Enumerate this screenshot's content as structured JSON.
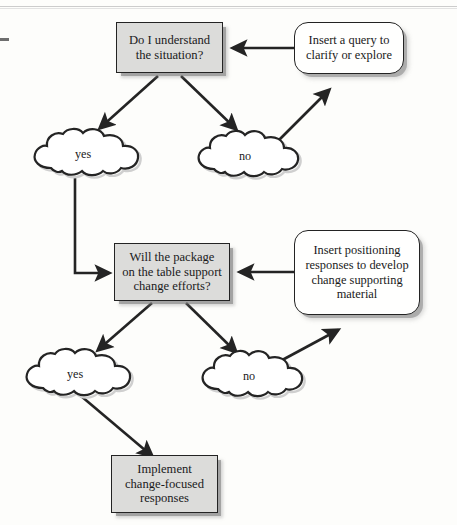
{
  "page": {
    "kind": "scanned-book-figure",
    "background_color": "#fdfdfb",
    "ink_color": "#1a1a1a",
    "box_fill_gray": "#dcdcda",
    "box_fill_white": "#fffffe",
    "border_color": "#232323"
  },
  "diagram": {
    "type": "flowchart",
    "title": "",
    "nodes": [
      {
        "id": "q1",
        "shape": "rectangle",
        "fill": "gray",
        "lines": [
          "Do I understand",
          "the situation?"
        ],
        "text": "Do I understand the situation?"
      },
      {
        "id": "insert1",
        "shape": "rounded-rectangle",
        "fill": "white",
        "lines": [
          "Insert a query to",
          "clarify or explore"
        ],
        "text": "Insert a query to clarify or explore"
      },
      {
        "id": "yes1",
        "shape": "cloud",
        "fill": "white",
        "lines": [
          "yes"
        ],
        "text": "yes"
      },
      {
        "id": "no1",
        "shape": "cloud",
        "fill": "white",
        "lines": [
          "no"
        ],
        "text": "no"
      },
      {
        "id": "q2",
        "shape": "rectangle",
        "fill": "gray",
        "lines": [
          "Will the package",
          "on the table support",
          "change efforts?"
        ],
        "text": "Will the package on the table support change efforts?"
      },
      {
        "id": "insert2",
        "shape": "rounded-rectangle",
        "fill": "white",
        "lines": [
          "Insert positioning",
          "responses to develop",
          "change supporting",
          "material"
        ],
        "text": "Insert positioning responses to develop change supporting material"
      },
      {
        "id": "yes2",
        "shape": "cloud",
        "fill": "white",
        "lines": [
          "yes"
        ],
        "text": "yes"
      },
      {
        "id": "no2",
        "shape": "cloud",
        "fill": "white",
        "lines": [
          "no"
        ],
        "text": "no"
      },
      {
        "id": "implement",
        "shape": "rectangle",
        "fill": "gray",
        "lines": [
          "Implement",
          "change-focused",
          "responses"
        ],
        "text": "Implement change-focused responses"
      }
    ],
    "edges": [
      {
        "from": "q1",
        "to": "yes1",
        "style": "diagonal-arrow"
      },
      {
        "from": "q1",
        "to": "no1",
        "style": "diagonal-arrow"
      },
      {
        "from": "no1",
        "to": "insert1",
        "style": "diagonal-arrow"
      },
      {
        "from": "insert1",
        "to": "q1",
        "style": "horizontal-arrow"
      },
      {
        "from": "yes1",
        "to": "q2",
        "style": "elbow-arrow"
      },
      {
        "from": "q2",
        "to": "yes2",
        "style": "diagonal-arrow"
      },
      {
        "from": "q2",
        "to": "no2",
        "style": "diagonal-arrow"
      },
      {
        "from": "no2",
        "to": "insert2",
        "style": "diagonal-arrow"
      },
      {
        "from": "insert2",
        "to": "q2",
        "style": "horizontal-arrow"
      },
      {
        "from": "yes2",
        "to": "implement",
        "style": "diagonal-arrow"
      }
    ]
  }
}
